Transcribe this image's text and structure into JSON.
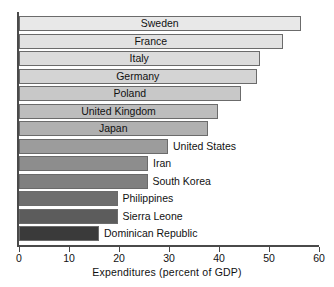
{
  "chart_data": {
    "type": "bar",
    "orientation": "horizontal",
    "title": "",
    "xlabel": "Expenditures (percent of GDP)",
    "ylabel": "",
    "xlim": [
      0,
      60
    ],
    "xticks": [
      0,
      10,
      20,
      30,
      40,
      50,
      60
    ],
    "xtick_labels": [
      "0",
      "10",
      "20",
      "30",
      "40",
      "50",
      "60"
    ],
    "grid": false,
    "legend": "none",
    "categories": [
      "Sweden",
      "France",
      "Italy",
      "Germany",
      "Poland",
      "United Kingdom",
      "Japan",
      "United States",
      "Iran",
      "South Korea",
      "Philippines",
      "Sierra Leone",
      "Dominican Republic"
    ],
    "values": [
      56.3,
      52.7,
      48.1,
      47.5,
      44.3,
      39.8,
      37.7,
      29.8,
      25.8,
      25.7,
      19.7,
      19.7,
      16.0
    ],
    "bar_colors": [
      "#e8e8e8",
      "#e2e2e2",
      "#dcdcdc",
      "#d4d4d4",
      "#c8c8c8",
      "#bdbdbd",
      "#b0b0b0",
      "#9c9c9c",
      "#8d8d8d",
      "#808080",
      "#6e6e6e",
      "#5c5c5c",
      "#3a3a3a"
    ],
    "label_placement": [
      "inside",
      "inside",
      "inside",
      "inside",
      "inside",
      "inside",
      "inside",
      "outside",
      "outside",
      "outside",
      "outside",
      "outside",
      "outside"
    ],
    "bar_border_color": "#6b6b6b",
    "axis_color": "#4a4a4a",
    "background_color": "#ffffff"
  }
}
